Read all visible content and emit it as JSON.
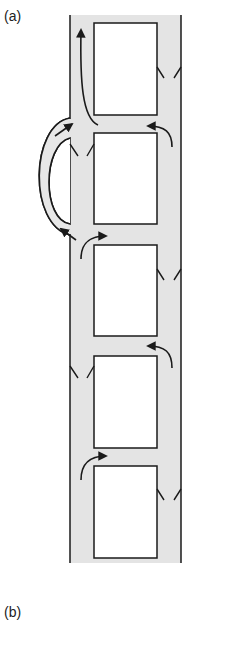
{
  "panels": {
    "a": {
      "label": "(a)"
    },
    "b": {
      "label": "(b)"
    }
  },
  "colors": {
    "channel_fill": "#e4e4e4",
    "stroke": "#1a1a1a",
    "box_fill": "#ffffff",
    "background": "#ffffff"
  },
  "diagram": {
    "channel": {
      "x_left": 70,
      "x_right": 181,
      "y_top": 15,
      "y_bottom": 563
    },
    "boxes": [
      {
        "x": 94,
        "y": 23,
        "w": 63,
        "h": 92
      },
      {
        "x": 94,
        "y": 133,
        "w": 63,
        "h": 91
      },
      {
        "x": 94,
        "y": 245,
        "w": 63,
        "h": 91
      },
      {
        "x": 94,
        "y": 356,
        "w": 63,
        "h": 92
      },
      {
        "x": 94,
        "y": 466,
        "w": 63,
        "h": 92
      }
    ],
    "notches": [
      {
        "side": "right",
        "y": 68
      },
      {
        "side": "left",
        "y": 145
      },
      {
        "side": "right",
        "y": 270
      },
      {
        "side": "left",
        "y": 366
      },
      {
        "side": "right",
        "y": 490
      }
    ],
    "arrows": [
      {
        "id": "up-left-top",
        "desc": "curved arrow up along left lane of box 1"
      },
      {
        "id": "right-into-gap-1",
        "desc": "right lane curves left into gap between box 1 and 2"
      },
      {
        "id": "bypass-outer",
        "desc": "outer bypass loop upward"
      },
      {
        "id": "bypass-inner",
        "desc": "inner bypass loop downward"
      },
      {
        "id": "left-into-gap-2",
        "desc": "left lane curves right into gap between box 2 and 3"
      },
      {
        "id": "right-into-gap-3",
        "desc": "right lane curves left into gap between box 3 and 4"
      },
      {
        "id": "left-into-gap-4",
        "desc": "left lane curves right into gap between box 4 and 5"
      }
    ]
  }
}
